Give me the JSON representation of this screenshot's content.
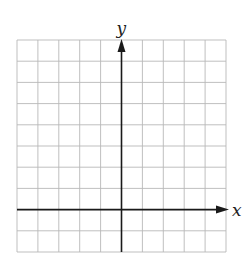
{
  "diagram": {
    "type": "coordinate-grid",
    "grid": {
      "columns": 10,
      "rows": 10,
      "left": 17,
      "top": 40,
      "cell_width": 20.9,
      "cell_height": 21.2,
      "line_color": "#b8b8b8"
    },
    "axes": {
      "x_label": "x",
      "y_label": "y",
      "y_axis_column": 5,
      "x_axis_row": 8,
      "axis_color": "#1a1a1a"
    }
  }
}
